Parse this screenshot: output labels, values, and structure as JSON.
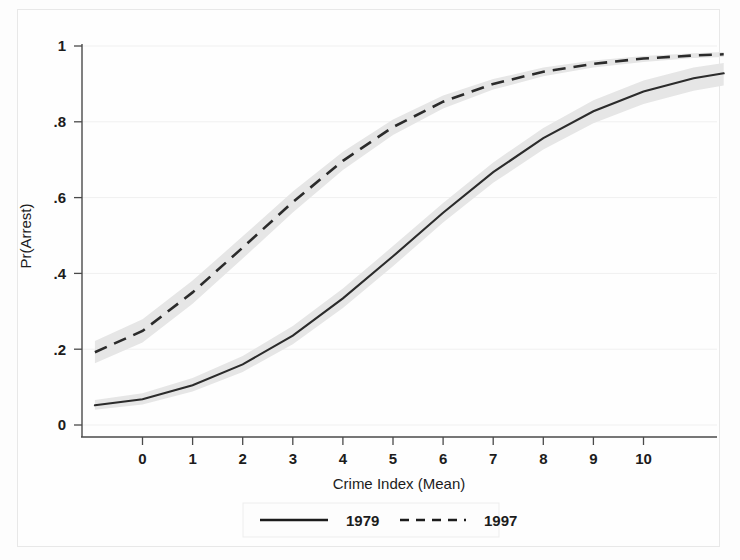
{
  "chart_data": {
    "type": "line",
    "title": "",
    "xlabel": "Crime Index (Mean)",
    "ylabel": "Pr(Arrest)",
    "xlim": [
      -0.95,
      11.6
    ],
    "ylim": [
      0,
      1
    ],
    "xticks": [
      0,
      1,
      2,
      3,
      4,
      5,
      6,
      7,
      8,
      9,
      10
    ],
    "xticklabels": [
      "0",
      "1",
      "2",
      "3",
      "4",
      "5",
      "6",
      "7",
      "8",
      "9",
      "10"
    ],
    "yticks": [
      0,
      0.2,
      0.4,
      0.6,
      0.8,
      1
    ],
    "yticklabels": [
      "0",
      ".2",
      ".4",
      ".6",
      ".8",
      "1"
    ],
    "grid": "horizontal",
    "legend_position": "below",
    "shaded_band": "95% confidence interval",
    "band_color": "#e6e6e6",
    "line_color": "#2b2b2b",
    "x": [
      -0.95,
      0,
      1,
      2,
      3,
      4,
      5,
      6,
      7,
      8,
      9,
      10,
      11,
      11.6
    ],
    "series": [
      {
        "name": "1979",
        "style": "solid",
        "values": [
          0.052,
          0.068,
          0.105,
          0.16,
          0.236,
          0.334,
          0.445,
          0.56,
          0.667,
          0.757,
          0.828,
          0.88,
          0.915,
          0.928
        ],
        "ci_lower": [
          0.04,
          0.054,
          0.088,
          0.14,
          0.213,
          0.309,
          0.419,
          0.534,
          0.639,
          0.727,
          0.796,
          0.847,
          0.882,
          0.896
        ],
        "ci_upper": [
          0.066,
          0.084,
          0.124,
          0.182,
          0.261,
          0.36,
          0.472,
          0.586,
          0.693,
          0.784,
          0.857,
          0.909,
          0.943,
          0.955
        ]
      },
      {
        "name": "1997",
        "style": "dashed",
        "values": [
          0.192,
          0.248,
          0.35,
          0.468,
          0.588,
          0.697,
          0.786,
          0.853,
          0.9,
          0.932,
          0.953,
          0.967,
          0.975,
          0.978
        ],
        "ci_lower": [
          0.163,
          0.218,
          0.32,
          0.439,
          0.561,
          0.673,
          0.765,
          0.835,
          0.885,
          0.92,
          0.943,
          0.958,
          0.968,
          0.971
        ],
        "ci_upper": [
          0.222,
          0.279,
          0.381,
          0.498,
          0.616,
          0.721,
          0.806,
          0.869,
          0.913,
          0.943,
          0.962,
          0.974,
          0.981,
          0.984
        ]
      }
    ],
    "legend": [
      {
        "label": "1979",
        "style": "solid"
      },
      {
        "label": "1997",
        "style": "dashed"
      }
    ]
  }
}
